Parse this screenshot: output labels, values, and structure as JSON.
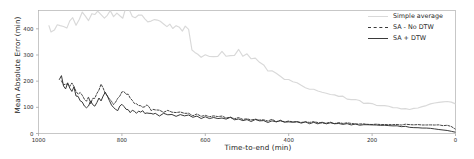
{
  "chart_data": {
    "type": "line",
    "title": "",
    "xlabel": "Time-to-end (min)",
    "ylabel": "Mean Absolute Error (min)",
    "xlim": [
      1000,
      0
    ],
    "ylim": [
      0,
      470
    ],
    "x_reversed": true,
    "grid": false,
    "legend_position": "upper right",
    "xticks": [
      1000,
      800,
      600,
      400,
      200,
      0
    ],
    "xticklabels": [
      "1000",
      "800",
      "600",
      "400",
      "200",
      "0"
    ],
    "yticks": [
      0,
      100,
      200,
      300,
      400
    ],
    "yticklabels": [
      "0",
      "100",
      "200",
      "300",
      "400"
    ],
    "series": [
      {
        "name": "Simple average",
        "color": "#d9d9d9",
        "style": "solid",
        "x": [
          975,
          970,
          962,
          955,
          948,
          940,
          932,
          925,
          918,
          910,
          902,
          895,
          888,
          880,
          872,
          865,
          858,
          850,
          842,
          835,
          828,
          820,
          812,
          805,
          798,
          790,
          782,
          775,
          768,
          760,
          752,
          745,
          738,
          730,
          722,
          715,
          708,
          700,
          692,
          685,
          678,
          670,
          662,
          655,
          648,
          640,
          632,
          625,
          618,
          610,
          600,
          590,
          580,
          570,
          560,
          550,
          540,
          530,
          520,
          510,
          500,
          490,
          480,
          470,
          460,
          450,
          440,
          430,
          420,
          410,
          400,
          390,
          380,
          370,
          360,
          350,
          340,
          330,
          320,
          310,
          300,
          290,
          280,
          270,
          260,
          250,
          240,
          230,
          220,
          210,
          200,
          190,
          180,
          170,
          160,
          150,
          140,
          130,
          120,
          110,
          100,
          90,
          80,
          70,
          60,
          50,
          40,
          30,
          20,
          10,
          0
        ],
        "y": [
          402,
          398,
          404,
          410,
          408,
          418,
          414,
          424,
          430,
          426,
          436,
          448,
          440,
          432,
          444,
          458,
          452,
          446,
          438,
          452,
          466,
          458,
          450,
          442,
          456,
          468,
          460,
          452,
          444,
          456,
          450,
          444,
          438,
          432,
          440,
          434,
          428,
          420,
          416,
          410,
          404,
          412,
          408,
          402,
          398,
          392,
          310,
          306,
          300,
          296,
          300,
          304,
          298,
          302,
          306,
          300,
          304,
          308,
          312,
          306,
          300,
          292,
          282,
          270,
          258,
          246,
          234,
          224,
          216,
          208,
          200,
          194,
          188,
          182,
          178,
          172,
          168,
          162,
          158,
          154,
          150,
          146,
          142,
          138,
          134,
          130,
          126,
          122,
          118,
          114,
          112,
          108,
          106,
          104,
          102,
          100,
          98,
          96,
          96,
          95,
          97,
          100,
          104,
          108,
          112,
          116,
          120,
          122,
          124,
          120,
          112
        ]
      },
      {
        "name": "SA - No DTW",
        "color": "#3a3a3a",
        "style": "dashed",
        "x": [
          945,
          940,
          935,
          930,
          925,
          920,
          915,
          910,
          905,
          900,
          895,
          890,
          885,
          880,
          875,
          870,
          865,
          860,
          855,
          850,
          845,
          840,
          835,
          830,
          825,
          820,
          815,
          810,
          805,
          800,
          795,
          790,
          785,
          780,
          775,
          770,
          765,
          760,
          755,
          750,
          745,
          740,
          735,
          730,
          725,
          720,
          710,
          700,
          690,
          680,
          670,
          660,
          650,
          640,
          630,
          620,
          610,
          600,
          590,
          580,
          570,
          560,
          550,
          540,
          530,
          520,
          510,
          500,
          490,
          480,
          470,
          460,
          450,
          440,
          430,
          420,
          410,
          400,
          390,
          380,
          370,
          360,
          350,
          340,
          330,
          320,
          310,
          300,
          290,
          280,
          270,
          260,
          250,
          240,
          230,
          220,
          210,
          200,
          190,
          180,
          170,
          160,
          150,
          140,
          130,
          120,
          110,
          100,
          90,
          80,
          70,
          60,
          50,
          40,
          30,
          20,
          10,
          0
        ],
        "y": [
          205,
          186,
          196,
          180,
          172,
          190,
          176,
          160,
          148,
          158,
          140,
          130,
          120,
          134,
          118,
          128,
          140,
          152,
          168,
          184,
          170,
          156,
          144,
          132,
          122,
          110,
          118,
          130,
          142,
          154,
          166,
          158,
          146,
          134,
          124,
          116,
          112,
          106,
          102,
          98,
          104,
          110,
          100,
          92,
          96,
          90,
          86,
          82,
          88,
          80,
          76,
          82,
          74,
          78,
          70,
          74,
          66,
          70,
          64,
          68,
          62,
          66,
          58,
          62,
          56,
          60,
          54,
          58,
          52,
          56,
          50,
          54,
          48,
          52,
          46,
          50,
          45,
          48,
          44,
          46,
          42,
          44,
          41,
          43,
          40,
          42,
          39,
          41,
          38,
          40,
          37,
          39,
          37,
          38,
          36,
          37,
          35,
          36,
          35,
          36,
          34,
          35,
          34,
          35,
          34,
          35,
          34,
          34,
          33,
          34,
          33,
          33,
          32,
          32,
          31,
          30,
          26,
          16
        ]
      },
      {
        "name": "SA + DTW",
        "color": "#2e2e2e",
        "style": "solid",
        "x": [
          950,
          945,
          940,
          935,
          930,
          925,
          920,
          915,
          910,
          905,
          900,
          895,
          890,
          885,
          880,
          875,
          870,
          865,
          860,
          855,
          850,
          845,
          840,
          835,
          830,
          825,
          820,
          815,
          810,
          805,
          800,
          795,
          790,
          785,
          780,
          775,
          770,
          765,
          760,
          755,
          750,
          745,
          740,
          735,
          730,
          725,
          720,
          710,
          700,
          690,
          680,
          670,
          660,
          650,
          640,
          630,
          620,
          610,
          600,
          590,
          580,
          570,
          560,
          550,
          540,
          530,
          520,
          510,
          500,
          490,
          480,
          470,
          460,
          450,
          440,
          430,
          420,
          410,
          400,
          390,
          380,
          370,
          360,
          350,
          340,
          330,
          320,
          310,
          300,
          290,
          280,
          270,
          260,
          250,
          240,
          230,
          220,
          210,
          200,
          190,
          180,
          170,
          160,
          150,
          140,
          130,
          120,
          110,
          100,
          90,
          80,
          70,
          60,
          50,
          40,
          30,
          20,
          10,
          0
        ],
        "y": [
          200,
          212,
          190,
          178,
          192,
          168,
          158,
          170,
          150,
          138,
          128,
          118,
          108,
          94,
          106,
          120,
          110,
          100,
          116,
          130,
          120,
          136,
          150,
          138,
          126,
          114,
          104,
          96,
          90,
          100,
          112,
          104,
          96,
          90,
          84,
          92,
          86,
          80,
          86,
          78,
          84,
          76,
          82,
          74,
          80,
          72,
          78,
          70,
          76,
          68,
          74,
          66,
          72,
          64,
          70,
          62,
          68,
          60,
          66,
          58,
          64,
          56,
          62,
          54,
          60,
          52,
          58,
          50,
          56,
          48,
          54,
          46,
          52,
          44,
          50,
          43,
          48,
          42,
          46,
          41,
          44,
          40,
          43,
          39,
          42,
          38,
          41,
          37,
          40,
          36,
          38,
          35,
          37,
          34,
          36,
          33,
          34,
          32,
          33,
          31,
          32,
          30,
          30,
          28,
          28,
          26,
          26,
          24,
          23,
          22,
          21,
          20,
          19,
          17,
          15,
          13,
          11,
          8,
          5
        ]
      }
    ]
  },
  "legend": {
    "items": [
      {
        "label": "Simple average"
      },
      {
        "label": "SA - No DTW"
      },
      {
        "label": "SA + DTW"
      }
    ]
  }
}
